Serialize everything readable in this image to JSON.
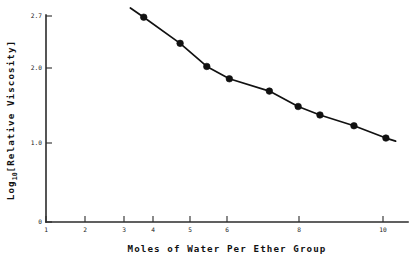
{
  "chart_data": {
    "type": "line",
    "title": "",
    "subtitle": "",
    "xlabel": "Moles of Water Per Ether Group",
    "ylabel": "Log10 [Relative Viscosity]",
    "ylabel_base": "Log",
    "ylabel_subscript": "10",
    "ylabel_bracket": "[Relative Viscosity]",
    "xscale": "log",
    "yscale": "linear",
    "xlim": [
      1,
      11
    ],
    "ylim": [
      0,
      2.7
    ],
    "grid": false,
    "legend": null,
    "marker": "filled-circle",
    "line_color": "#111111",
    "marker_color": "#111111",
    "xticks": [
      1,
      2,
      3,
      4,
      5,
      6,
      8,
      10
    ],
    "xtick_labels": [
      "1",
      "2",
      "3",
      "4",
      "5",
      "6",
      "8",
      "10"
    ],
    "yticks": [
      0,
      1.0,
      2.0,
      2.7
    ],
    "ytick_labels": [
      "0",
      "1.0",
      "2.0",
      "2.7"
    ],
    "x": [
      1.95,
      2.5,
      3.0,
      3.5,
      4.6,
      5.6,
      6.5,
      8.2,
      10.2
    ],
    "values": [
      2.66,
      2.32,
      2.02,
      1.86,
      1.7,
      1.5,
      1.39,
      1.25,
      1.09
    ],
    "points": [
      {
        "x": 1.95,
        "y": 2.66
      },
      {
        "x": 2.5,
        "y": 2.32
      },
      {
        "x": 3.0,
        "y": 2.02
      },
      {
        "x": 3.5,
        "y": 1.86
      },
      {
        "x": 4.6,
        "y": 1.7
      },
      {
        "x": 5.6,
        "y": 1.5
      },
      {
        "x": 6.5,
        "y": 1.39
      },
      {
        "x": 8.2,
        "y": 1.25
      },
      {
        "x": 10.2,
        "y": 1.09
      }
    ],
    "line_extends_left_to": {
      "x": 1.78,
      "y": 2.78
    },
    "line_extends_right_to": {
      "x": 10.9,
      "y": 1.05
    }
  }
}
